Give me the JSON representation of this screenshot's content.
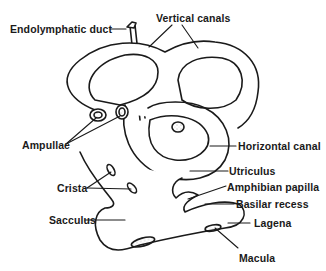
{
  "diagram": {
    "type": "anatomical-illustration",
    "colors": {
      "ink": "#1a1a1a",
      "background": "#ffffff",
      "stipple": "#555555"
    },
    "labels": {
      "endolymphatic_duct": "Endolymphatic duct",
      "vertical_canals": "Vertical canals",
      "ampullae": "Ampullae",
      "horizontal_canal": "Horizontal canal",
      "utriculus": "Utriculus",
      "crista": "Crista",
      "amphibian_papilla": "Amphibian papilla",
      "basilar_recess": "Basilar recess",
      "sacculus": "Sacculus",
      "lagena": "Lagena",
      "macula": "Macula"
    }
  }
}
